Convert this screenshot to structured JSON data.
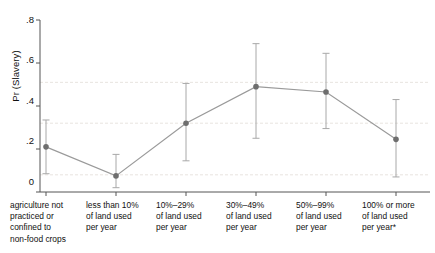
{
  "chart_data": {
    "type": "line",
    "title": "",
    "subtitle": "",
    "xlabel": "",
    "ylabel": "Pr (Slavery)",
    "ylim": [
      0,
      0.8
    ],
    "yticks": [
      0,
      0.2,
      0.4,
      0.6,
      0.8
    ],
    "ytick_labels": [
      "0",
      ".2",
      ".4",
      ".6",
      ".8"
    ],
    "grid": "faint horizontal dashed gridlines",
    "legend": "none",
    "marker": "filled gray circle",
    "errorbar_type": "95% confidence interval with caps",
    "categories": [
      "agriculture not practiced or confined to non-food crops",
      "less than 10% of land used per year",
      "10%–29% of land used per year",
      "30%–49% of land used per year",
      "50%–99% of land used per year",
      "100% or more of land used per year*"
    ],
    "category_lines": [
      [
        "agriculture not",
        "practiced or",
        "confined to",
        "non-food crops"
      ],
      [
        "less than 10%",
        "of land used",
        "per year"
      ],
      [
        "10%–29%",
        "of land used",
        "per year"
      ],
      [
        "30%–49%",
        "of land used",
        "per year"
      ],
      [
        "50%–99%",
        "of land used",
        "per year"
      ],
      [
        "100% or more",
        "of land used",
        "per year*"
      ]
    ],
    "values": [
      0.21,
      0.075,
      0.32,
      0.49,
      0.465,
      0.245
    ],
    "ci_lower": [
      0.085,
      0.02,
      0.145,
      0.25,
      0.295,
      0.07
    ],
    "ci_upper": [
      0.335,
      0.175,
      0.505,
      0.69,
      0.645,
      0.43
    ],
    "series": [
      {
        "name": "Pr (Slavery)",
        "values": [
          0.21,
          0.075,
          0.32,
          0.49,
          0.465,
          0.245
        ]
      }
    ],
    "gridline_values": [
      0.08,
      0.32,
      0.51
    ],
    "colors": {
      "marker": "#6e6e6e",
      "line": "#9a9a9a",
      "errorbar": "#a8a8a8",
      "axis": "#555555",
      "grid": "#e2ddd8",
      "text": "#111111",
      "background": "#ffffff"
    }
  },
  "footnote": "*"
}
